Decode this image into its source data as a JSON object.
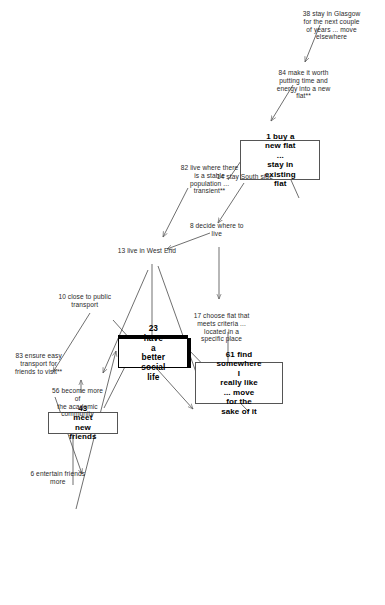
{
  "diagram": {
    "type": "causal-map",
    "orientation": "rotated-90-ccw",
    "nodes": [
      {
        "id": "n23",
        "ref": "23",
        "text": "23 have a better\nsocial life",
        "style": "goal-box"
      },
      {
        "id": "n43",
        "ref": "43",
        "text": "43 meet new friends",
        "style": "box"
      },
      {
        "id": "n61",
        "ref": "61",
        "text": "61 find somewhere I\nreally like ... move\nfor the sake of it",
        "style": "box"
      },
      {
        "id": "n1",
        "ref": "1",
        "text": "1 buy a new flat ...\nstay in existing\nflat",
        "style": "box"
      },
      {
        "id": "n6",
        "ref": "6",
        "text": "6 entertain friends\nmore",
        "style": "plain"
      },
      {
        "id": "n83",
        "ref": "83",
        "text": "83 ensure easy\ntransport for\nfriends to visit**",
        "style": "plain"
      },
      {
        "id": "n10",
        "ref": "10",
        "text": "10 close to public\ntransport",
        "style": "plain"
      },
      {
        "id": "n56",
        "ref": "56",
        "text": "56 become more of\nthe academic\ncommunity",
        "style": "plain"
      },
      {
        "id": "n13",
        "ref": "13",
        "text": "13 live in West End",
        "style": "plain"
      },
      {
        "id": "n17",
        "ref": "17",
        "text": "17 choose flat that\nmeets criteria ...\nlocated in a\nspecific place",
        "style": "plain"
      },
      {
        "id": "n8",
        "ref": "8",
        "text": "8 decide where to\nlive",
        "style": "plain"
      },
      {
        "id": "n14",
        "ref": "14",
        "text": "14 stay South side",
        "style": "plain"
      },
      {
        "id": "n82",
        "ref": "82",
        "text": "82 live where there\nis a stable\npopulation ...\ntransient**",
        "style": "plain"
      },
      {
        "id": "n84",
        "ref": "84",
        "text": "84 make it worth\nputting time and\nenergy into a new\nflat**",
        "style": "plain"
      },
      {
        "id": "n38",
        "ref": "38",
        "text": "38 stay in Glasgow\nfor the next couple\nof years ... move\nelsewhere",
        "style": "plain"
      }
    ],
    "edges": [
      {
        "from": "6",
        "to": "23"
      },
      {
        "from": "6",
        "to": "43"
      },
      {
        "from": "83",
        "to": "6"
      },
      {
        "from": "10",
        "to": "83"
      },
      {
        "from": "10",
        "to": "56"
      },
      {
        "from": "43",
        "to": "23"
      },
      {
        "from": "56",
        "to": "43"
      },
      {
        "from": "13",
        "to": "23"
      },
      {
        "from": "13",
        "to": "56"
      },
      {
        "from": "13",
        "to": "61"
      },
      {
        "from": "8",
        "to": "13"
      },
      {
        "from": "8",
        "to": "17"
      },
      {
        "from": "14",
        "to": "8"
      },
      {
        "from": "82",
        "to": "13"
      },
      {
        "from": "82",
        "to": "14"
      },
      {
        "from": "17",
        "to": "61"
      },
      {
        "from": "61",
        "to": "1"
      },
      {
        "from": "61",
        "to": "23"
      },
      {
        "from": "84",
        "to": "1"
      },
      {
        "from": "38",
        "to": "84"
      }
    ],
    "legend": {
      "asterisk_note": "**"
    },
    "colors": {
      "background": "#ffffff",
      "text": "#1a1a1a",
      "edge": "#555555",
      "box_border": "#555555",
      "goal_border": "#000000"
    }
  }
}
